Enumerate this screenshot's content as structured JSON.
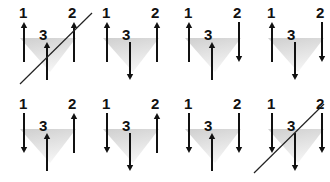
{
  "diagram": {
    "colors": {
      "arrow": "#111111",
      "triangle_shade": "#d8d8d8",
      "cross_line": "#222222"
    },
    "rows": 2,
    "cols": 4,
    "panels": [
      {
        "id": 1,
        "row": 0,
        "col": 0,
        "labels": [
          "1",
          "2",
          "3"
        ],
        "spins": {
          "1": "up",
          "2": "up",
          "3": "up"
        },
        "crossed": true
      },
      {
        "id": 2,
        "row": 0,
        "col": 1,
        "labels": [
          "1",
          "2",
          "3"
        ],
        "spins": {
          "1": "up",
          "2": "up",
          "3": "down"
        },
        "crossed": false
      },
      {
        "id": 3,
        "row": 0,
        "col": 2,
        "labels": [
          "1",
          "2",
          "3"
        ],
        "spins": {
          "1": "up",
          "2": "down",
          "3": "up"
        },
        "crossed": false
      },
      {
        "id": 4,
        "row": 0,
        "col": 3,
        "labels": [
          "1",
          "2",
          "3"
        ],
        "spins": {
          "1": "up",
          "2": "down",
          "3": "down"
        },
        "crossed": false
      },
      {
        "id": 5,
        "row": 1,
        "col": 0,
        "labels": [
          "1",
          "2",
          "3"
        ],
        "spins": {
          "1": "down",
          "2": "up",
          "3": "up"
        },
        "crossed": false
      },
      {
        "id": 6,
        "row": 1,
        "col": 1,
        "labels": [
          "1",
          "2",
          "3"
        ],
        "spins": {
          "1": "down",
          "2": "up",
          "3": "down"
        },
        "crossed": false
      },
      {
        "id": 7,
        "row": 1,
        "col": 2,
        "labels": [
          "1",
          "2",
          "3"
        ],
        "spins": {
          "1": "down",
          "2": "down",
          "3": "up"
        },
        "crossed": false
      },
      {
        "id": 8,
        "row": 1,
        "col": 3,
        "labels": [
          "1",
          "2",
          "3"
        ],
        "spins": {
          "1": "down",
          "2": "down",
          "3": "down"
        },
        "crossed": true
      }
    ]
  }
}
